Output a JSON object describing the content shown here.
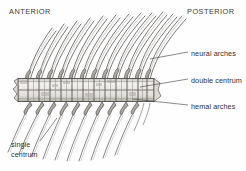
{
  "figure": {
    "kind": "anatomical-illustration",
    "background_color": "#fefefe",
    "ink_color": "#4a4a4a",
    "shade_color": "#b9b6b2"
  },
  "orientation": {
    "anterior_label": "ANTERIOR",
    "posterior_label": "POSTERIOR"
  },
  "labels": {
    "neural_arches": "neural arches",
    "double_centrum": "double centrum",
    "hemal_arches": "hemal arches",
    "single_centrum_line1": "single",
    "single_centrum_line2": "centrum"
  },
  "structure": {
    "centrum_count": 13,
    "neural_spine_count": 12,
    "hemal_spine_count": 10,
    "column_top_y": 78,
    "column_bottom_y": 102,
    "column_left_x": 18,
    "column_right_x": 152
  }
}
